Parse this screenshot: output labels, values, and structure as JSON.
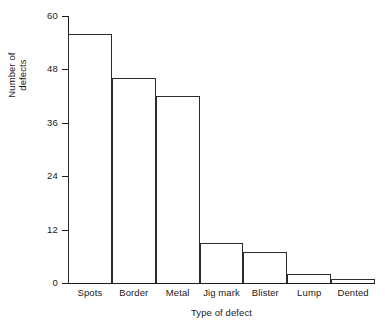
{
  "chart_data": {
    "type": "bar",
    "title": "",
    "xlabel": "Type of defect",
    "ylabel": "Number of defects",
    "ylabel_lines": [
      "Number of",
      "defects"
    ],
    "categories": [
      "Spots",
      "Border",
      "Metal",
      "Jig mark",
      "Blister",
      "Lump",
      "Dented"
    ],
    "values": [
      56,
      46,
      42,
      9,
      7,
      2,
      1
    ],
    "ylim": [
      0,
      60
    ],
    "yticks": [
      0,
      12,
      24,
      36,
      48,
      60
    ],
    "ytick_labels": [
      "0",
      "12",
      "24",
      "36",
      "48",
      "60"
    ],
    "grid": false,
    "legend": "none",
    "bar_style": {
      "fill": "#ffffff",
      "stroke": "#2b2b2b",
      "gap": 0
    },
    "axis_color": "#1a1a1a",
    "background": "#ffffff"
  }
}
